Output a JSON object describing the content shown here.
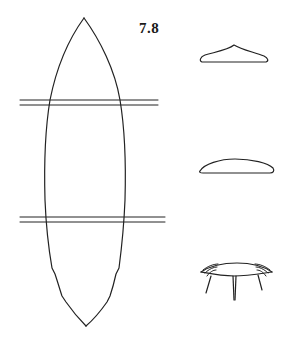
{
  "figure": {
    "label": "7.8",
    "label_position": {
      "x": 139,
      "y": 20
    },
    "stroke_color": "#222222",
    "background": "#ffffff"
  },
  "elements": {
    "main_view": {
      "description": "elongated pointed leaf/blade shape in plan view",
      "top_tip": [
        84,
        18
      ],
      "bottom_tip": [
        86,
        326
      ]
    },
    "section_lines": [
      {
        "name": "upper-section-line",
        "y": [
          100,
          105
        ],
        "x_range": [
          20,
          158
        ]
      },
      {
        "name": "lower-section-line",
        "y": [
          217,
          222
        ],
        "x_range": [
          20,
          165
        ]
      }
    ],
    "cross_sections": [
      {
        "name": "cross-section-top",
        "shape": "peaked",
        "bbox": [
          200,
          45,
          268,
          63
        ]
      },
      {
        "name": "cross-section-middle",
        "shape": "lens",
        "bbox": [
          200,
          158,
          274,
          173
        ]
      },
      {
        "name": "cross-section-bottom",
        "shape": "layered-with-legs",
        "bbox": [
          200,
          262,
          272,
          300
        ]
      }
    ]
  }
}
